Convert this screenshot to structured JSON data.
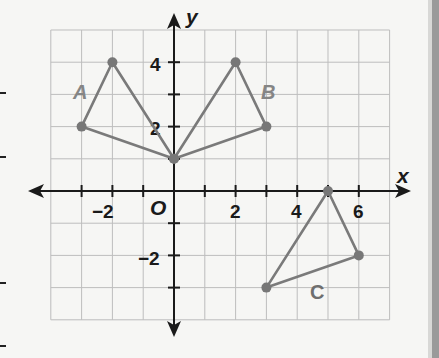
{
  "chart_data": {
    "type": "scatter",
    "title": "",
    "xlabel": "x",
    "ylabel": "y",
    "origin_label": "O",
    "xlim": [
      -4,
      7
    ],
    "ylim": [
      -4,
      5
    ],
    "grid": true,
    "x_tick_labels": [
      "-2",
      "2",
      "4",
      "6"
    ],
    "y_tick_labels": [
      "4",
      "2",
      "-2"
    ],
    "x_tick_values": [
      -2,
      2,
      4,
      6
    ],
    "y_tick_values": [
      4,
      2,
      -2
    ],
    "series": [
      {
        "name": "A",
        "shape": "triangle",
        "points": [
          [
            -3,
            2
          ],
          [
            -2,
            4
          ],
          [
            0,
            1
          ]
        ]
      },
      {
        "name": "B",
        "shape": "triangle",
        "points": [
          [
            0,
            1
          ],
          [
            2,
            4
          ],
          [
            3,
            2
          ]
        ]
      },
      {
        "name": "C",
        "shape": "triangle",
        "points": [
          [
            5,
            0
          ],
          [
            6,
            -2
          ],
          [
            3,
            -3
          ]
        ]
      }
    ],
    "colors": {
      "triangle_edge": "#7a7a7a",
      "grid": "#bdbdbd",
      "axis": "#1a1a1a"
    }
  },
  "labels": {
    "x_axis": "x",
    "y_axis": "y",
    "origin": "O",
    "tick_x_neg2": "−2",
    "tick_x_2": "2",
    "tick_x_4": "4",
    "tick_x_6": "6",
    "tick_y_4": "4",
    "tick_y_2": "2",
    "tick_y_neg2": "−2",
    "shape_a": "A",
    "shape_b": "B",
    "shape_c": "C"
  }
}
